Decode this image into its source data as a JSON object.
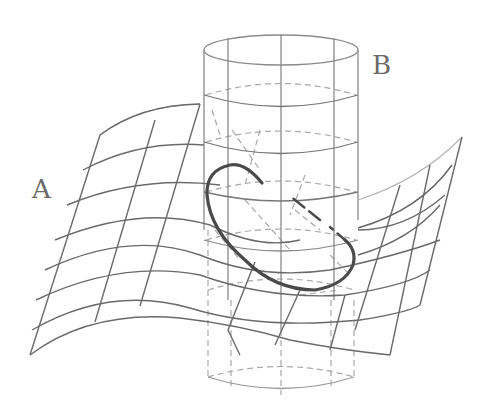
{
  "diagram": {
    "labels": {
      "surface": "A",
      "cylinder": "B"
    },
    "colors": {
      "background": "#ffffff",
      "grid_strong": "#5a5a5a",
      "grid_light": "#b0b0b0",
      "hidden_dashed": "#a0a0a0",
      "intersection_curve": "#4a4a4a",
      "label_text": "#6a6a6a"
    }
  }
}
